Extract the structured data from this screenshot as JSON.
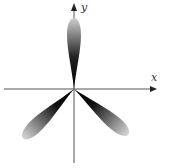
{
  "diagram": {
    "type": "polar-rose",
    "axes": {
      "x_label": "x",
      "y_label": "y"
    },
    "petals": [
      {
        "name": "top",
        "direction_deg": 90
      },
      {
        "name": "lower-left",
        "direction_deg": 225
      },
      {
        "name": "lower-right",
        "direction_deg": 315
      }
    ],
    "colors": {
      "axis": "#555555",
      "petal_dark": "#000000",
      "petal_light": "#d8d8d8",
      "background": "#ffffff"
    }
  }
}
